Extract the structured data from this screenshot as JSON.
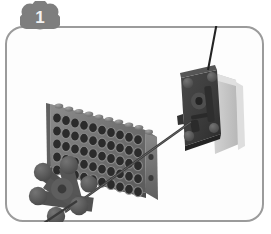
{
  "step": {
    "number": "1",
    "badge_icon": "brick-cluster-badge-icon",
    "badge_color": "#7e7e7e"
  },
  "frame": {
    "border_color": "#9b9b9b",
    "background_color": "#fdfdfd",
    "corner_radius_px": 18
  },
  "illustration": {
    "title": "lego-technic-assembly-step",
    "description": "Technic brick plate with axle hole grid, motor unit, cross axle connector and insertion arrow",
    "parts": [
      {
        "id": "technic-brick-plate",
        "name": "technic-brick-plate",
        "color": "#6f6f6f",
        "shade_dark": "#3e3e3e",
        "shade_light": "#9a9a9a",
        "hole_color": "#2d2d2d",
        "hole_rows": 5,
        "hole_cols": 11,
        "studs": 11
      },
      {
        "id": "motor-unit",
        "name": "motor-unit",
        "color": "#3a3a3a",
        "body_color": "#c9c9c9",
        "shadow_color": "#d8d8d8"
      },
      {
        "id": "cross-axle-connector",
        "name": "cross-axle-connector",
        "color": "#5c5c5c",
        "shade_dark": "#3c3c3c",
        "knobs": 6
      },
      {
        "id": "axle-rod",
        "name": "axle-rod",
        "color": "#3a3a3a"
      },
      {
        "id": "antenna-rod",
        "name": "antenna-rod",
        "color": "#262626"
      },
      {
        "id": "assembly-arrow",
        "name": "assembly-direction-arrow",
        "color": "#3a3a3a",
        "direction": "down-left"
      }
    ]
  },
  "colors": {
    "page_background": "#ffffff",
    "frame_border": "#9b9b9b",
    "badge_fill": "#7e7e7e",
    "badge_text": "#f2f2f2"
  }
}
